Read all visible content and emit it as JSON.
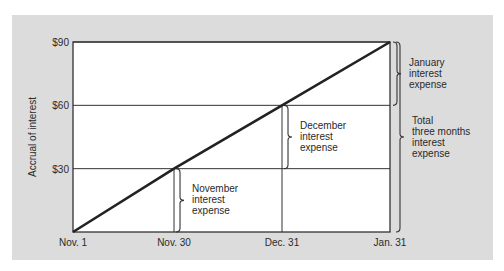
{
  "chart_data": {
    "type": "line",
    "title": "",
    "xlabel": "",
    "ylabel": "Accrual of interest",
    "x": [
      "Nov. 1",
      "Nov. 30",
      "Dec. 31",
      "Jan. 31"
    ],
    "x_days": [
      0,
      29,
      60,
      91
    ],
    "y_ticks": [
      {
        "value": 30,
        "label": "$30"
      },
      {
        "value": 60,
        "label": "$60"
      },
      {
        "value": 90,
        "label": "$90"
      }
    ],
    "ylim": [
      0,
      90
    ],
    "grid": true,
    "series": [
      {
        "name": "Accrued interest",
        "values": [
          0,
          30,
          60,
          90
        ]
      }
    ],
    "annotations": [
      {
        "id": "november",
        "lines": [
          "November",
          "interest",
          "expense"
        ],
        "x_index": 1,
        "y_from": 0,
        "y_to": 30
      },
      {
        "id": "december",
        "lines": [
          "December",
          "interest",
          "expense"
        ],
        "x_index": 2,
        "y_from": 30,
        "y_to": 60
      },
      {
        "id": "january",
        "lines": [
          "January",
          "interest",
          "expense"
        ],
        "x_index": 3,
        "y_from": 60,
        "y_to": 90
      },
      {
        "id": "total",
        "lines": [
          "Total",
          "three months",
          "interest",
          "expense"
        ],
        "x_index": 3,
        "y_from": 0,
        "y_to": 90
      }
    ],
    "colors": {
      "panel": "#dcdcdc",
      "plot": "#ffffff",
      "line": "#222222",
      "grid": "#333333",
      "text": "#2a2a2a"
    }
  }
}
